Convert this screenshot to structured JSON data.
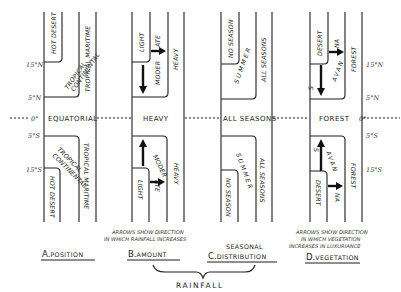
{
  "latitudes": {
    "left": {
      "n15": "15°N",
      "n5": "5°N",
      "eq": "0°",
      "s5": "5°S",
      "s15": "15°S"
    },
    "right": {
      "n15": "15°N",
      "n5": "5°N",
      "eq": "0°",
      "s5": "5°S",
      "s15": "15°S"
    }
  },
  "panels": {
    "position": {
      "title_letter": "A.",
      "title": "POSITION",
      "zones": {
        "outer": "HOT DESERT",
        "middle_line1": "TROPICAL",
        "middle_line2": "CONTINENTAL",
        "inner": "TROPICAL MARITIME",
        "center": "EQUATORIAL"
      }
    },
    "amount": {
      "title_letter": "B.",
      "title": "AMOUNT",
      "zones": {
        "outer": "LIGHT",
        "middle_a": "MODER",
        "middle_b": "ATE",
        "inner": "HEAVY",
        "center": "HEAVY"
      },
      "note_line1": "ARROWS SHOW DIRECTION",
      "note_line2": "IN WHICH RAINFALL INCREASES"
    },
    "seasonal": {
      "title_top": "SEASONAL",
      "title_letter": "C.",
      "title": "DISTRIBUTION",
      "zones": {
        "outer": "NO SEASON",
        "middle": "SUMMER",
        "inner": "ALL SEASONS",
        "center": "ALL SEASONS"
      }
    },
    "vegetation": {
      "title_letter": "D.",
      "title": "VEGETATION",
      "zones": {
        "outer": "DESERT",
        "middle_a": "S",
        "middle_b": "AVAN",
        "middle_c": "NA",
        "inner": "FOREST",
        "center": "FOREST"
      },
      "note_line1": "ARROWS SHOW DIRECTION",
      "note_line2": "IN WHICH VEGETATION",
      "note_line3": "INCREASES IN LUXURIANCE"
    }
  },
  "group_label": "RAINFALL"
}
